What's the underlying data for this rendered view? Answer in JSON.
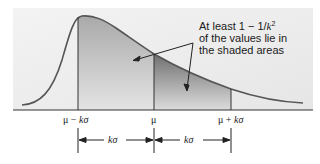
{
  "diagram": {
    "callout": {
      "line1_prefix": "At least 1 − 1/",
      "line1_var": "k",
      "line1_exp": "2",
      "line2": "of the values lie in",
      "line3": "the shaded areas"
    },
    "axis_labels": {
      "left": {
        "prefix": "μ − ",
        "k": "k",
        "sigma": "σ"
      },
      "center": "μ",
      "right": {
        "prefix": "μ + ",
        "k": "k",
        "sigma": "σ"
      }
    },
    "intervals": [
      {
        "k": "k",
        "sigma": "σ"
      },
      {
        "k": "k",
        "sigma": "σ"
      }
    ],
    "colors": {
      "panel_bg": "#ececec",
      "curve": "#555555",
      "shade_light": "#b8b8b8",
      "shade_dark": "#7a7a7a",
      "line": "#333333"
    }
  }
}
